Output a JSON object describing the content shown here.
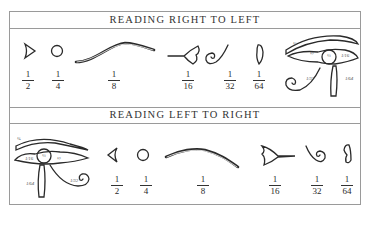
{
  "panels": [
    {
      "title": "READING RIGHT TO LEFT",
      "fractions": [
        {
          "num": "1",
          "den": "2",
          "glyph": "eye-corner-triangle"
        },
        {
          "num": "1",
          "den": "4",
          "glyph": "pupil-circle"
        },
        {
          "num": "1",
          "den": "8",
          "glyph": "eyebrow-curve"
        },
        {
          "num": "1",
          "den": "16",
          "glyph": "eye-corner-teardrop"
        },
        {
          "num": "1",
          "den": "32",
          "glyph": "spiral-curl"
        },
        {
          "num": "1",
          "den": "64",
          "glyph": "vertical-stroke"
        }
      ],
      "eye_labels": [
        "1/8",
        "1/2",
        "1/4",
        "1/16",
        "1/32",
        "1/64"
      ]
    },
    {
      "title": "READING LEFT TO RIGHT",
      "fractions": [
        {
          "num": "1",
          "den": "2",
          "glyph": "eye-corner-triangle"
        },
        {
          "num": "1",
          "den": "4",
          "glyph": "pupil-circle"
        },
        {
          "num": "1",
          "den": "8",
          "glyph": "eyebrow-curve"
        },
        {
          "num": "1",
          "den": "16",
          "glyph": "eye-corner-teardrop"
        },
        {
          "num": "1",
          "den": "32",
          "glyph": "spiral-curl"
        },
        {
          "num": "1",
          "den": "64",
          "glyph": "vertical-stroke"
        }
      ],
      "eye_labels": [
        "1/8",
        "1/16",
        "1/4",
        "1/2",
        "1/64",
        "1/32"
      ]
    }
  ],
  "colors": {
    "ink": "#2a2a2a",
    "rule": "#9a9a9a"
  }
}
